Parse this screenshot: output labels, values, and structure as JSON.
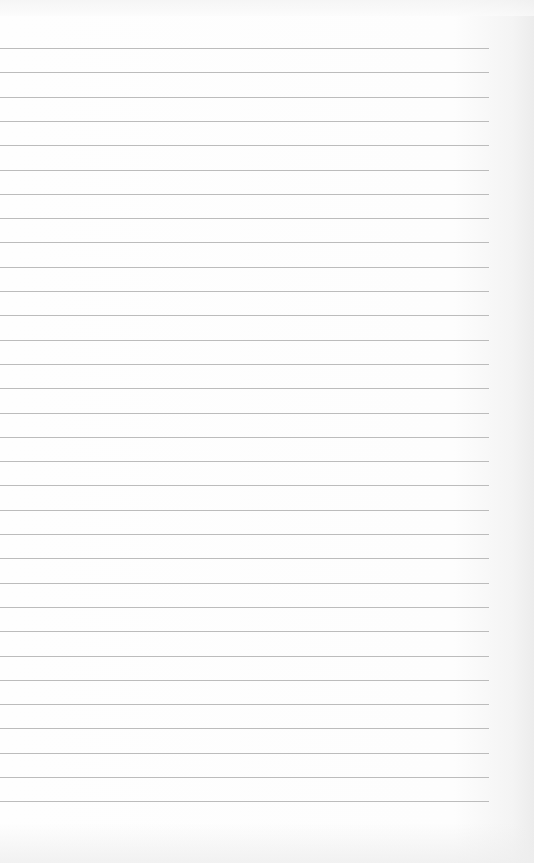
{
  "page": {
    "type": "lined-paper",
    "line_count": 32,
    "colors": {
      "paper": "#fdfdfd",
      "rule": "#bcbcbc"
    }
  }
}
